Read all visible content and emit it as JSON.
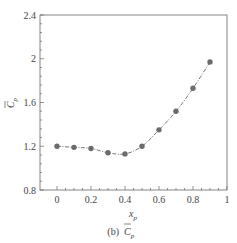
{
  "chart_data": {
    "type": "line",
    "title": "",
    "caption": "(b)",
    "caption_symbol": "C",
    "caption_subscript": "p",
    "xlabel": "x",
    "xlabel_subscript": "p",
    "ylabel": "C",
    "ylabel_subscript": "p",
    "xlim": [
      -0.1,
      1
    ],
    "ylim": [
      0.8,
      2.4
    ],
    "xticks": [
      0,
      0.2,
      0.4,
      0.6,
      0.8,
      1
    ],
    "xtick_labels": [
      "0",
      "0.2",
      "0.4",
      "0.6",
      "0.8",
      "1"
    ],
    "yticks": [
      0.8,
      1.2,
      1.6,
      2,
      2.4
    ],
    "ytick_labels": [
      "0.8",
      "1.2",
      "1.6",
      "2",
      "2.4"
    ],
    "grid": false,
    "legend": null,
    "series": [
      {
        "name": "mean Cp",
        "marker": "circle",
        "line_style": "dash-dot",
        "color": "#555555",
        "x": [
          0,
          0.1,
          0.2,
          0.3,
          0.4,
          0.5,
          0.6,
          0.7,
          0.8,
          0.9
        ],
        "y": [
          1.2,
          1.19,
          1.18,
          1.14,
          1.13,
          1.2,
          1.35,
          1.52,
          1.73,
          1.97
        ]
      }
    ]
  },
  "colors": {
    "axis": "#666666",
    "marker": "#6b6b6b",
    "line": "#555555"
  }
}
